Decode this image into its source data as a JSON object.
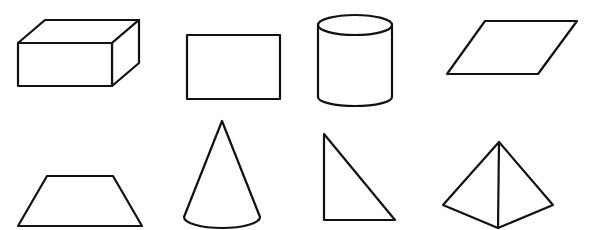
{
  "figure": {
    "width": 590,
    "height": 230,
    "background": "#ffffff",
    "stroke_color": "#111111",
    "shapes": [
      {
        "id": "cuboid",
        "kind": "3D",
        "name": "rectangular prism"
      },
      {
        "id": "rectangle",
        "kind": "2D",
        "name": "rectangle"
      },
      {
        "id": "cylinder",
        "kind": "3D",
        "name": "cylinder"
      },
      {
        "id": "parallelogram",
        "kind": "2D",
        "name": "parallelogram"
      },
      {
        "id": "trapezoid",
        "kind": "2D",
        "name": "trapezoid"
      },
      {
        "id": "cone",
        "kind": "3D",
        "name": "cone"
      },
      {
        "id": "right-triangle",
        "kind": "2D",
        "name": "right triangle"
      },
      {
        "id": "pyramid",
        "kind": "3D",
        "name": "triangular pyramid"
      }
    ]
  }
}
